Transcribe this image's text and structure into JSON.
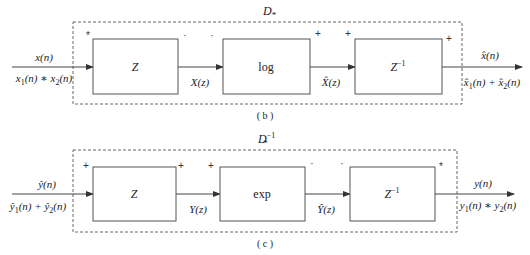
{
  "diagrams": [
    {
      "id": "b",
      "caption": "( b )",
      "system_label": "D",
      "system_sub": "*",
      "system_sup": "",
      "input": {
        "top": "x(n)",
        "bottom": "x1(n) * x2(n)"
      },
      "output": {
        "top": "x̂(n)",
        "bottom": "x̂1(n) + x̂2(n)"
      },
      "blocks": [
        {
          "label": "Z",
          "sup": "",
          "in_sign": "*",
          "out_sign": "·"
        },
        {
          "label": "log",
          "sup": "",
          "in_sign": "·",
          "out_sign": "+"
        },
        {
          "label": "Z",
          "sup": "−1",
          "in_sign": "+",
          "out_sign": "+"
        }
      ],
      "edges": [
        {
          "label": "X(z)"
        },
        {
          "label": "X̂(z)"
        }
      ]
    },
    {
      "id": "c",
      "caption": "( c )",
      "system_label": "D",
      "system_sub": "*",
      "system_sup": "−1",
      "input": {
        "top": "ŷ(n)",
        "bottom": "ŷ1(n) + ŷ2(n)"
      },
      "output": {
        "top": "y(n)",
        "bottom": "y1(n) * y2(n)"
      },
      "blocks": [
        {
          "label": "Z",
          "sup": "",
          "in_sign": "+",
          "out_sign": "+"
        },
        {
          "label": "exp",
          "sup": "",
          "in_sign": "+",
          "out_sign": "·"
        },
        {
          "label": "Z",
          "sup": "−1",
          "in_sign": "·",
          "out_sign": "*"
        }
      ],
      "edges": [
        {
          "label": "Y(z)"
        },
        {
          "label": "Ŷ(z)"
        }
      ]
    }
  ]
}
